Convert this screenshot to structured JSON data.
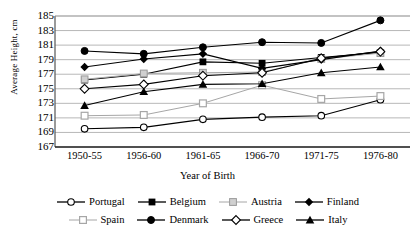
{
  "chart_data": {
    "type": "line",
    "title": "",
    "xlabel": "Year of Birth",
    "ylabel": "Average Height, cm",
    "categories": [
      "1950-55",
      "1956-60",
      "1961-65",
      "1966-70",
      "1971-75",
      "1976-80"
    ],
    "ylim": [
      167,
      185
    ],
    "yticks": [
      185,
      183,
      181,
      179,
      177,
      175,
      173,
      171,
      169,
      167
    ],
    "grid": true,
    "legend_position": "bottom",
    "series": [
      {
        "name": "Portugal",
        "marker": "open-circle",
        "color": "#000000",
        "values": [
          169.5,
          169.7,
          170.8,
          171.1,
          171.3,
          173.5
        ]
      },
      {
        "name": "Belgium",
        "marker": "filled-square",
        "color": "#000000",
        "values": [
          176.2,
          177.0,
          178.7,
          178.5,
          179.3,
          180.0
        ]
      },
      {
        "name": "Austria",
        "marker": "light-square",
        "color": "#a6a6a6",
        "values": [
          176.3,
          177.1,
          177.2,
          177.3,
          179.1,
          179.9
        ]
      },
      {
        "name": "Finland",
        "marker": "filled-diamond",
        "color": "#000000",
        "values": [
          178.0,
          179.1,
          179.8,
          177.8,
          179.0,
          180.2
        ]
      },
      {
        "name": "Spain",
        "marker": "light-open-square",
        "color": "#a6a6a6",
        "values": [
          171.3,
          171.4,
          173.0,
          175.5,
          173.6,
          174.0
        ]
      },
      {
        "name": "Denmark",
        "marker": "filled-circle",
        "color": "#000000",
        "values": [
          180.2,
          179.8,
          180.7,
          181.4,
          181.3,
          184.4
        ]
      },
      {
        "name": "Greece",
        "marker": "open-diamond",
        "color": "#000000",
        "values": [
          175.0,
          175.6,
          176.8,
          177.2,
          179.2,
          180.1
        ]
      },
      {
        "name": "Italy",
        "marker": "filled-triangle",
        "color": "#000000",
        "values": [
          172.7,
          174.6,
          175.6,
          175.7,
          177.2,
          178.0
        ]
      }
    ]
  },
  "axis": {
    "ylabel": "Average Height, cm",
    "xlabel": "Year of Birth",
    "yticks": [
      "185",
      "183",
      "181",
      "179",
      "177",
      "175",
      "173",
      "171",
      "169",
      "167"
    ],
    "xticks": [
      "1950-55",
      "1956-60",
      "1961-65",
      "1966-70",
      "1971-75",
      "1976-80"
    ]
  },
  "legend": {
    "row1": [
      "Portugal",
      "Belgium",
      "Austria",
      "Finland"
    ],
    "row2": [
      "Spain",
      "Denmark",
      "Greece",
      "Italy"
    ]
  }
}
